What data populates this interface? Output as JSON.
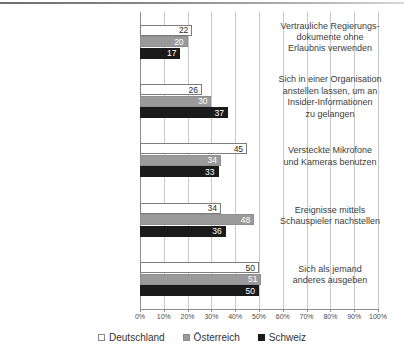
{
  "chart_data": {
    "type": "bar",
    "orientation": "horizontal",
    "title": "",
    "subtitle": "",
    "xlabel": "",
    "ylabel": "",
    "xlim": [
      0,
      100
    ],
    "xunit": "%",
    "grid": true,
    "legend_position": "bottom",
    "categories": [
      "Vertrauliche Regierungs-\ndokumente ohne\nErlaubnis verwenden",
      "Sich in einer Organisation\nanstellen lassen, um an\nInsider-Informationen\nzu gelangen",
      "Versteckte Mikrofone\nund Kameras benutzen",
      "Ereignisse mittels\nSchauspieler nachstellen",
      "Sich als jemand\nanderes ausgeben"
    ],
    "category_lines": [
      [
        "Vertrauliche Regierungs-",
        "dokumente ohne",
        "Erlaubnis verwenden"
      ],
      [
        "Sich in einer Organisation",
        "anstellen lassen, um an",
        "Insider-Informationen",
        "zu gelangen"
      ],
      [
        "Versteckte Mikrofone",
        "und Kameras benutzen"
      ],
      [
        "Ereignisse mittels",
        "Schauspieler nachstellen"
      ],
      [
        "Sich als jemand",
        "anderes ausgeben"
      ]
    ],
    "series": [
      {
        "name": "Deutschland",
        "color": "#ffffff",
        "values": [
          22,
          26,
          45,
          34,
          50
        ]
      },
      {
        "name": "Österreich",
        "color": "#9a9a9a",
        "values": [
          20,
          30,
          34,
          48,
          51
        ]
      },
      {
        "name": "Schweiz",
        "color": "#1a1a1a",
        "values": [
          17,
          37,
          33,
          36,
          50
        ]
      }
    ],
    "xticks": [
      0,
      10,
      20,
      30,
      40,
      50,
      60,
      70,
      80,
      90,
      100
    ],
    "xtick_labels": [
      "0%",
      "10%",
      "20%",
      "30%",
      "40%",
      "50%",
      "60%",
      "70%",
      "80%",
      "90%",
      "100%"
    ]
  },
  "legend": {
    "items": [
      {
        "label": "Deutschland",
        "key": "de"
      },
      {
        "label": "Österreich",
        "key": "at"
      },
      {
        "label": "Schweiz",
        "key": "ch"
      }
    ]
  },
  "colors": {
    "deutschland": "#ffffff",
    "oesterreich": "#9a9a9a",
    "schweiz": "#1a1a1a",
    "grid": "#c9c9c9",
    "axis": "#8d8d8d",
    "text": "#333333"
  }
}
